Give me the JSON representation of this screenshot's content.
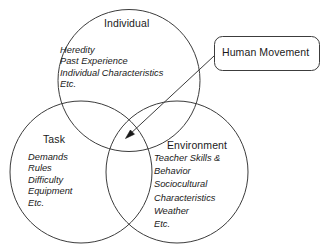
{
  "diagram": {
    "type": "venn-diagram",
    "stroke_color": "#3c3c3c",
    "text_color": "#1a1a1a",
    "background_color": "#ffffff",
    "circles": [
      {
        "id": "individual",
        "title": "Individual",
        "items": [
          "Heredity",
          "Past Experience",
          "Individual Characteristics",
          "Etc."
        ]
      },
      {
        "id": "task",
        "title": "Task",
        "items": [
          "Demands",
          "Rules",
          "Difficulty",
          "Equipment",
          "Etc."
        ]
      },
      {
        "id": "environment",
        "title": "Environment",
        "items": [
          "Teacher Skills &",
          "Behavior",
          "Sociocultural",
          "Characteristics",
          "Weather",
          "Etc."
        ]
      }
    ],
    "callout": {
      "label": "Human Movement",
      "shape": "rounded-rectangle",
      "points_to": "center-intersection"
    }
  }
}
